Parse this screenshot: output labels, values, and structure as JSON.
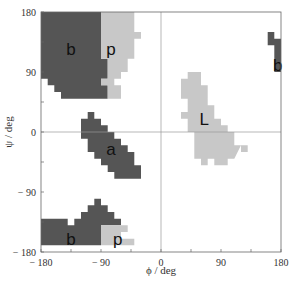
{
  "chart_data": {
    "type": "heatmap",
    "title": "",
    "xlabel": "ϕ / deg",
    "ylabel": "ψ / deg",
    "xlim": [
      -180,
      180
    ],
    "ylim": [
      -180,
      180
    ],
    "xticks": [
      -180,
      -90,
      0,
      90,
      180
    ],
    "yticks": [
      -180,
      -90,
      0,
      90,
      180
    ],
    "xtick_labels": [
      "− 180",
      "− 90",
      "0",
      "90",
      "180"
    ],
    "ytick_labels": [
      "− 180",
      "− 90",
      "0",
      "90",
      "180"
    ],
    "grid": false,
    "zero_lines": true,
    "colors": {
      "dark": "#555555",
      "light": "#c8c8c8",
      "frame": "#666666"
    },
    "regions": [
      {
        "label": "b",
        "shade": "dark",
        "label_pos": [
          -135,
          125
        ],
        "polygon": [
          [
            -180,
            180
          ],
          [
            -90,
            180
          ],
          [
            -90,
            110
          ],
          [
            -80,
            110
          ],
          [
            -80,
            80
          ],
          [
            -90,
            80
          ],
          [
            -90,
            70
          ],
          [
            -80,
            70
          ],
          [
            -80,
            50
          ],
          [
            -150,
            50
          ],
          [
            -150,
            60
          ],
          [
            -160,
            60
          ],
          [
            -160,
            70
          ],
          [
            -170,
            70
          ],
          [
            -170,
            80
          ],
          [
            -180,
            80
          ]
        ]
      },
      {
        "label": "p",
        "shade": "light",
        "label_pos": [
          -75,
          125
        ],
        "polygon": [
          [
            -90,
            180
          ],
          [
            -40,
            180
          ],
          [
            -40,
            150
          ],
          [
            -30,
            150
          ],
          [
            -30,
            140
          ],
          [
            -40,
            140
          ],
          [
            -40,
            110
          ],
          [
            -50,
            110
          ],
          [
            -50,
            90
          ],
          [
            -60,
            90
          ],
          [
            -60,
            80
          ],
          [
            -70,
            80
          ],
          [
            -70,
            70
          ],
          [
            -60,
            70
          ],
          [
            -60,
            50
          ],
          [
            -80,
            50
          ],
          [
            -80,
            70
          ],
          [
            -90,
            70
          ],
          [
            -90,
            80
          ],
          [
            -80,
            80
          ],
          [
            -80,
            110
          ],
          [
            -90,
            110
          ]
        ]
      },
      {
        "label": "a",
        "shade": "dark",
        "label_pos": [
          -75,
          -25
        ],
        "polygon": [
          [
            -120,
            20
          ],
          [
            -110,
            20
          ],
          [
            -110,
            30
          ],
          [
            -100,
            30
          ],
          [
            -100,
            20
          ],
          [
            -90,
            20
          ],
          [
            -90,
            10
          ],
          [
            -80,
            10
          ],
          [
            -80,
            0
          ],
          [
            -70,
            0
          ],
          [
            -70,
            -10
          ],
          [
            -60,
            -10
          ],
          [
            -60,
            -20
          ],
          [
            -50,
            -20
          ],
          [
            -50,
            -30
          ],
          [
            -40,
            -30
          ],
          [
            -40,
            -50
          ],
          [
            -30,
            -50
          ],
          [
            -30,
            -70
          ],
          [
            -70,
            -70
          ],
          [
            -70,
            -60
          ],
          [
            -80,
            -60
          ],
          [
            -80,
            -50
          ],
          [
            -90,
            -50
          ],
          [
            -90,
            -40
          ],
          [
            -100,
            -40
          ],
          [
            -100,
            -30
          ],
          [
            -110,
            -30
          ],
          [
            -110,
            -10
          ],
          [
            -120,
            -10
          ],
          [
            -120,
            -5
          ]
        ]
      },
      {
        "label": "L",
        "shade": "light",
        "label_pos": [
          65,
          20
        ],
        "polygon": [
          [
            30,
            80
          ],
          [
            40,
            80
          ],
          [
            40,
            90
          ],
          [
            60,
            90
          ],
          [
            60,
            70
          ],
          [
            70,
            70
          ],
          [
            70,
            40
          ],
          [
            80,
            40
          ],
          [
            80,
            20
          ],
          [
            90,
            20
          ],
          [
            90,
            10
          ],
          [
            100,
            10
          ],
          [
            100,
            0
          ],
          [
            110,
            0
          ],
          [
            110,
            -20
          ],
          [
            120,
            -20
          ],
          [
            120,
            -30
          ],
          [
            130,
            -30
          ],
          [
            130,
            -20
          ],
          [
            120,
            -20
          ],
          [
            110,
            -40
          ],
          [
            100,
            -40
          ],
          [
            100,
            -50
          ],
          [
            80,
            -50
          ],
          [
            80,
            -40
          ],
          [
            70,
            -40
          ],
          [
            70,
            -50
          ],
          [
            60,
            -50
          ],
          [
            60,
            -40
          ],
          [
            50,
            -40
          ],
          [
            50,
            0
          ],
          [
            40,
            0
          ],
          [
            40,
            20
          ],
          [
            30,
            20
          ],
          [
            30,
            30
          ],
          [
            40,
            30
          ],
          [
            40,
            50
          ],
          [
            30,
            50
          ]
        ]
      },
      {
        "label": "b",
        "shade": "dark",
        "label_pos": [
          175,
          100
        ],
        "polygon": [
          [
            160,
            150
          ],
          [
            170,
            150
          ],
          [
            170,
            140
          ],
          [
            180,
            140
          ],
          [
            180,
            90
          ],
          [
            170,
            90
          ],
          [
            170,
            130
          ],
          [
            160,
            130
          ]
        ]
      },
      {
        "label": "b",
        "shade": "dark",
        "label_pos": [
          -135,
          -160
        ],
        "polygon": [
          [
            -180,
            -130
          ],
          [
            -140,
            -130
          ],
          [
            -140,
            -140
          ],
          [
            -130,
            -140
          ],
          [
            -130,
            -130
          ],
          [
            -120,
            -130
          ],
          [
            -120,
            -120
          ],
          [
            -110,
            -120
          ],
          [
            -110,
            -110
          ],
          [
            -100,
            -110
          ],
          [
            -100,
            -100
          ],
          [
            -90,
            -100
          ],
          [
            -90,
            -110
          ],
          [
            -80,
            -110
          ],
          [
            -80,
            -120
          ],
          [
            -70,
            -120
          ],
          [
            -70,
            -130
          ],
          [
            -60,
            -130
          ],
          [
            -60,
            -140
          ],
          [
            -90,
            -140
          ],
          [
            -90,
            -170
          ],
          [
            -180,
            -170
          ]
        ]
      },
      {
        "label": "p",
        "shade": "light",
        "label_pos": [
          -65,
          -160
        ],
        "polygon": [
          [
            -90,
            -140
          ],
          [
            -50,
            -140
          ],
          [
            -50,
            -150
          ],
          [
            -60,
            -150
          ],
          [
            -60,
            -160
          ],
          [
            -40,
            -160
          ],
          [
            -40,
            -170
          ],
          [
            -90,
            -170
          ]
        ]
      }
    ]
  }
}
